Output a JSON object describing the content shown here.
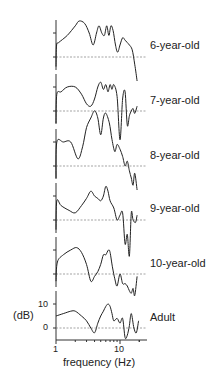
{
  "chart_data": {
    "type": "line",
    "title": "",
    "xlabel": "frequency (Hz)",
    "ylabel": "(dB)",
    "x_scale": "log",
    "xlim": [
      1,
      25
    ],
    "x_ticks": [
      "1",
      "10"
    ],
    "y_ticks_adult": [
      "10",
      "0"
    ],
    "grid": false,
    "baseline_style": "dashed at 0 dB",
    "panel_scale_db": 10,
    "series": [
      {
        "name": "6-year-old",
        "x": [
          1,
          1.02,
          1.1,
          1.5,
          2.0,
          2.3,
          2.8,
          3.3,
          3.8,
          4.3,
          4.7,
          5.2,
          5.7,
          6.2,
          6.7,
          7.2,
          7.8,
          8.5,
          9.2,
          10,
          11,
          12,
          13,
          14,
          15.5,
          17,
          18.5
        ],
        "values": [
          -4,
          5,
          6,
          9,
          13,
          15,
          14,
          10,
          5,
          10,
          13,
          10,
          9,
          13,
          9,
          13,
          11,
          5,
          2,
          5,
          8,
          7,
          6,
          5,
          3,
          -3,
          -10
        ]
      },
      {
        "name": "7-year-old",
        "x": [
          1,
          1.03,
          1.2,
          1.5,
          2.0,
          2.5,
          3.0,
          3.5,
          4.0,
          4.5,
          5.0,
          5.5,
          6.0,
          6.5,
          7.0,
          7.5,
          8.0,
          9.0,
          10.0,
          11.0,
          12.0,
          13.0,
          14.0,
          15.0,
          16.0,
          17.0,
          18.5
        ],
        "values": [
          -5,
          7,
          8,
          10,
          10,
          7,
          3,
          2,
          5,
          10,
          12,
          9,
          11,
          8,
          11,
          9,
          11,
          6,
          -12,
          5,
          8,
          -6,
          -2,
          0,
          1,
          -1,
          2
        ]
      },
      {
        "name": "8-year-old",
        "x": [
          1,
          1.03,
          1.3,
          1.7,
          2.2,
          2.6,
          3.0,
          3.5,
          4.0,
          4.5,
          5.0,
          5.5,
          6.0,
          6.8,
          7.5,
          8.3,
          9.0,
          10.0,
          11.0,
          12.0,
          13.0,
          14.0,
          15.0,
          16.0,
          17.0,
          18.5
        ],
        "values": [
          -5,
          10,
          10,
          10,
          3,
          8,
          16,
          20,
          23,
          20,
          13,
          20,
          22,
          18,
          11,
          6,
          9,
          7,
          4,
          0,
          2,
          -2,
          -5,
          -8,
          -3,
          -10
        ]
      },
      {
        "name": "9-year-old",
        "x": [
          1,
          1.03,
          1.2,
          1.6,
          2.0,
          2.5,
          3.0,
          3.5,
          4.0,
          4.5,
          5.0,
          5.5,
          6.0,
          6.5,
          7.0,
          8.0,
          9.0,
          10.0,
          11.0,
          12.0,
          13.0,
          14.0,
          15.0,
          16.0,
          17.5,
          18.5
        ],
        "values": [
          -4,
          8,
          6,
          4,
          3,
          6,
          9,
          12,
          10,
          9,
          8,
          10,
          14,
          12,
          8,
          5,
          0,
          2,
          3,
          -10,
          -6,
          -15,
          3,
          0,
          -1,
          2
        ]
      },
      {
        "name": "10-year-old",
        "x": [
          1,
          1.05,
          1.3,
          1.7,
          2.1,
          2.5,
          3.0,
          3.5,
          4.0,
          4.5,
          5.0,
          5.5,
          6.0,
          6.6,
          7.0,
          7.6,
          8.3,
          9.0,
          10.0,
          11.0,
          12.0,
          13.0,
          14.0,
          15.0,
          16.0,
          17.0,
          18.5
        ],
        "values": [
          -3,
          5,
          8,
          10,
          11,
          9,
          4,
          -3,
          -1,
          1,
          4,
          8,
          8,
          10,
          9,
          3,
          -2,
          -5,
          0,
          -4,
          -4,
          -5,
          -7,
          -8,
          -6,
          -9,
          -1
        ]
      },
      {
        "name": "Adult",
        "x": [
          1,
          1.3,
          1.7,
          2.0,
          2.5,
          3.0,
          3.5,
          4.0,
          4.5,
          5.0,
          5.5,
          6.0,
          6.5,
          7.0,
          7.5,
          8.0,
          9.0,
          10.0,
          11.0,
          12.0,
          13.0,
          14.0,
          15.0,
          16.5,
          18.0,
          19.5
        ],
        "values": [
          5,
          6,
          7,
          7,
          5,
          3,
          0,
          -2,
          2,
          5,
          7,
          9,
          10,
          9,
          6,
          3,
          4,
          2,
          4,
          -4,
          -3,
          1,
          6,
          0,
          -2,
          3
        ]
      }
    ]
  },
  "labels": {
    "series_labels": [
      "6-year-old",
      "7-year-old",
      "8-year-old",
      "9-year-old",
      "10-year-old",
      "Adult"
    ],
    "ylabel": "(dB)",
    "xlabel": "frequency (Hz)",
    "x_tick_1": "1",
    "x_tick_10": "10",
    "y_tick_10": "10",
    "y_tick_0": "0"
  }
}
